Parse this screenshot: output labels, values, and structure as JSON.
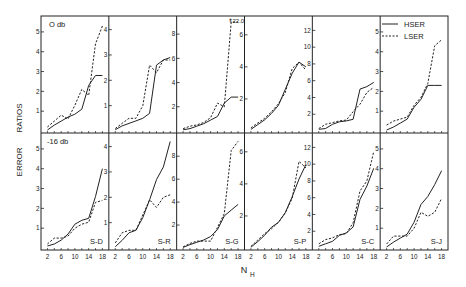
{
  "chart_data": {
    "type": "line",
    "title": "",
    "ylabel": "ERROR   RATIOS",
    "xlabel": "N_H",
    "x": [
      2,
      4,
      6,
      8,
      10,
      12,
      14,
      16,
      18
    ],
    "xticks": [
      "2",
      "6",
      "10",
      "14",
      "18"
    ],
    "legend": [
      {
        "name": "HSER",
        "style": "solid"
      },
      {
        "name": "LSER",
        "style": "dashed"
      }
    ],
    "legend_position": "top-right",
    "rows": [
      {
        "label": "O db"
      },
      {
        "label": "-16 db"
      }
    ],
    "columns": [
      "S-D",
      "S-R",
      "S-G",
      "S-P",
      "S-C",
      "S-J"
    ],
    "annotations": [
      {
        "text": "22.0",
        "panel": "top S-G",
        "note": "LSER off-scale arrow"
      }
    ],
    "panels": [
      {
        "row": 0,
        "col": 0,
        "name": "S-D",
        "ymax": 5.5,
        "yticks": [
          "1",
          "2",
          "3",
          "4",
          "5"
        ],
        "series": [
          {
            "name": "HSER",
            "values": [
              0.05,
              0.3,
              0.5,
              0.7,
              0.85,
              1.1,
              2.3,
              2.8,
              2.8
            ]
          },
          {
            "name": "LSER",
            "values": [
              0.2,
              0.5,
              0.8,
              0.6,
              1.3,
              2.1,
              1.8,
              4.4,
              5.3
            ]
          }
        ]
      },
      {
        "row": 0,
        "col": 1,
        "name": "S-R",
        "ymax": 4.3,
        "yticks": [
          "1",
          "2",
          "3",
          "4"
        ],
        "series": [
          {
            "name": "HSER",
            "values": [
              0.05,
              0.2,
              0.3,
              0.4,
              0.5,
              0.7,
              2.6,
              2.8,
              2.9
            ]
          },
          {
            "name": "LSER",
            "values": [
              0.1,
              0.3,
              0.5,
              0.5,
              1.0,
              2.6,
              2.3,
              2.8,
              2.8
            ]
          }
        ]
      },
      {
        "row": 0,
        "col": 2,
        "name": "S-G",
        "ymax": 9,
        "yticks": [
          "2",
          "4",
          "6",
          "8"
        ],
        "series": [
          {
            "name": "HSER",
            "values": [
              0.1,
              0.2,
              0.4,
              0.6,
              0.9,
              1.2,
              2.3,
              2.8,
              2.8
            ]
          },
          {
            "name": "LSER",
            "values": [
              0.2,
              0.4,
              0.5,
              0.7,
              1.1,
              2.3,
              2.0,
              9.0,
              9.0
            ]
          }
        ]
      },
      {
        "row": 0,
        "col": 3,
        "name": "S-P",
        "ymax": 6.8,
        "yticks": [
          "2",
          "4",
          "6"
        ],
        "series": [
          {
            "name": "HSER",
            "values": [
              0.1,
              0.4,
              0.7,
              1.1,
              1.6,
              2.6,
              3.6,
              4.3,
              4.0
            ]
          },
          {
            "name": "LSER",
            "values": [
              0.2,
              0.5,
              0.8,
              1.2,
              1.7,
              2.4,
              3.9,
              4.3,
              3.8
            ]
          }
        ]
      },
      {
        "row": 0,
        "col": 4,
        "name": "S-C",
        "ymax": 13,
        "yticks": [
          "2",
          "4",
          "6",
          "8",
          "10",
          "12"
        ],
        "series": [
          {
            "name": "HSER",
            "values": [
              0.2,
              0.3,
              0.8,
              1.1,
              1.2,
              1.4,
              5.0,
              5.3,
              5.8
            ]
          },
          {
            "name": "LSER",
            "values": [
              0.3,
              0.8,
              1.0,
              1.2,
              1.3,
              2.3,
              3.2,
              4.6,
              5.2
            ]
          }
        ]
      },
      {
        "row": 0,
        "col": 5,
        "name": "S-J",
        "ymax": 5.5,
        "yticks": [
          "1",
          "2",
          "3",
          "4",
          "5"
        ],
        "series": [
          {
            "name": "HSER",
            "values": [
              0.05,
              0.2,
              0.4,
              0.6,
              1.2,
              1.6,
              2.3,
              2.3,
              2.3
            ]
          },
          {
            "name": "LSER",
            "values": [
              0.3,
              0.5,
              0.6,
              0.7,
              1.3,
              1.7,
              2.4,
              4.3,
              4.6
            ]
          }
        ]
      },
      {
        "row": 1,
        "col": 0,
        "name": "S-D",
        "ymax": 5.5,
        "yticks": [
          "1",
          "2",
          "3",
          "4",
          "5"
        ],
        "series": [
          {
            "name": "HSER",
            "values": [
              0.1,
              0.2,
              0.4,
              0.7,
              1.2,
              1.4,
              1.5,
              2.6,
              4.0
            ]
          },
          {
            "name": "LSER",
            "values": [
              0.2,
              0.5,
              0.5,
              0.6,
              1.0,
              1.2,
              1.3,
              2.3,
              2.4
            ]
          }
        ]
      },
      {
        "row": 1,
        "col": 1,
        "name": "S-R",
        "ymax": 4.3,
        "yticks": [
          "1",
          "2",
          "3",
          "4"
        ],
        "series": [
          {
            "name": "HSER",
            "values": [
              0.05,
              0.3,
              0.6,
              0.7,
              1.2,
              1.9,
              2.7,
              3.2,
              4.2
            ]
          },
          {
            "name": "LSER",
            "values": [
              0.2,
              0.6,
              0.7,
              0.7,
              1.3,
              1.9,
              1.6,
              2.0,
              2.1
            ]
          }
        ]
      },
      {
        "row": 1,
        "col": 2,
        "name": "S-G",
        "ymax": 9.5,
        "yticks": [
          "2",
          "4",
          "6",
          "8"
        ],
        "series": [
          {
            "name": "HSER",
            "values": [
              0.05,
              0.3,
              0.5,
              0.7,
              1.0,
              1.6,
              2.8,
              3.3,
              3.8
            ]
          },
          {
            "name": "LSER",
            "values": [
              0.1,
              0.4,
              0.6,
              0.6,
              0.6,
              1.8,
              3.0,
              8.5,
              9.3
            ]
          }
        ]
      },
      {
        "row": 1,
        "col": 3,
        "name": "S-P",
        "ymax": 6.8,
        "yticks": [
          "2",
          "4",
          "6"
        ],
        "series": [
          {
            "name": "HSER",
            "values": [
              0.05,
              0.4,
              0.8,
              1.3,
              1.6,
              2.2,
              3.2,
              4.3,
              5.2
            ]
          },
          {
            "name": "LSER",
            "values": [
              0.1,
              0.5,
              0.9,
              1.2,
              1.6,
              2.2,
              3.1,
              5.4,
              5.0
            ]
          }
        ]
      },
      {
        "row": 1,
        "col": 4,
        "name": "S-C",
        "ymax": 13,
        "yticks": [
          "2",
          "4",
          "6",
          "8",
          "10",
          "12"
        ],
        "series": [
          {
            "name": "HSER",
            "values": [
              0.2,
              0.5,
              0.8,
              1.5,
              1.8,
              2.5,
              5.8,
              7.4,
              9.5
            ]
          },
          {
            "name": "LSER",
            "values": [
              0.5,
              1.0,
              1.2,
              1.6,
              1.7,
              3.0,
              6.8,
              8.0,
              11.5
            ]
          }
        ]
      },
      {
        "row": 1,
        "col": 5,
        "name": "S-J",
        "ymax": 5.5,
        "yticks": [
          "1",
          "2",
          "3",
          "4",
          "5"
        ],
        "series": [
          {
            "name": "HSER",
            "values": [
              0.05,
              0.3,
              0.5,
              0.7,
              1.3,
              2.2,
              2.6,
              3.2,
              3.9
            ]
          },
          {
            "name": "LSER",
            "values": [
              0.2,
              0.6,
              0.6,
              0.6,
              1.0,
              1.8,
              1.6,
              1.8,
              2.5
            ]
          }
        ]
      }
    ]
  }
}
